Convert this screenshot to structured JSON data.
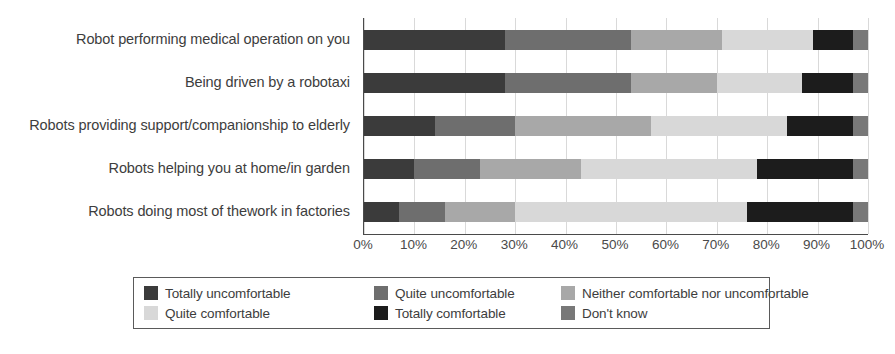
{
  "chart_data": {
    "type": "bar",
    "orientation": "horizontal",
    "stacked": true,
    "normalized_percent": true,
    "title": "",
    "xlabel": "",
    "ylabel": "",
    "xlim": [
      0,
      100
    ],
    "grid": true,
    "legend_position": "bottom",
    "xticks": [
      "0%",
      "10%",
      "20%",
      "30%",
      "40%",
      "50%",
      "60%",
      "70%",
      "80%",
      "90%",
      "100%"
    ],
    "xtick_values": [
      0,
      10,
      20,
      30,
      40,
      50,
      60,
      70,
      80,
      90,
      100
    ],
    "categories": [
      "Robot performing medical operation on you",
      "Being driven by a robotaxi",
      "Robots providing support/companionship to elderly",
      "Robots helping you at home/in garden",
      "Robots doing most of thework in factories"
    ],
    "series": [
      {
        "name": "Totally uncomfortable",
        "color": "#3b3b3b",
        "values": [
          28,
          28,
          14,
          10,
          7
        ]
      },
      {
        "name": "Quite uncomfortable",
        "color": "#6e6e6e",
        "values": [
          25,
          25,
          16,
          13,
          9
        ]
      },
      {
        "name": "Neither comfortable nor uncomfortable",
        "color": "#a8a8a8",
        "values": [
          18,
          17,
          27,
          20,
          14
        ]
      },
      {
        "name": "Quite comfortable",
        "color": "#d8d8d8",
        "values": [
          18,
          17,
          27,
          35,
          46
        ]
      },
      {
        "name": "Totally comfortable",
        "color": "#1c1c1c",
        "values": [
          8,
          10,
          13,
          19,
          21
        ]
      },
      {
        "name": "Don't know",
        "color": "#787878",
        "values": [
          3,
          3,
          3,
          3,
          3
        ]
      }
    ]
  },
  "legend": {
    "items": [
      {
        "label": "Totally uncomfortable",
        "color": "#3b3b3b"
      },
      {
        "label": "Quite uncomfortable",
        "color": "#6e6e6e"
      },
      {
        "label": "Neither comfortable nor uncomfortable",
        "color": "#a8a8a8"
      },
      {
        "label": "Quite comfortable",
        "color": "#d8d8d8"
      },
      {
        "label": "Totally comfortable",
        "color": "#1c1c1c"
      },
      {
        "label": "Don't know",
        "color": "#787878"
      }
    ]
  }
}
